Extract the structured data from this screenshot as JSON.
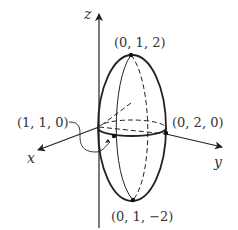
{
  "figure": {
    "axes": {
      "z": "z",
      "x": "x",
      "y": "y"
    },
    "points": {
      "top": "(0, 1, 2)",
      "bottom": "(0, 1, −2)",
      "front": "(1, 1, 0)",
      "right": "(0, 2, 0)"
    },
    "colors": {
      "stroke": "#222222",
      "text": "#333333",
      "background": "#ffffff"
    }
  }
}
